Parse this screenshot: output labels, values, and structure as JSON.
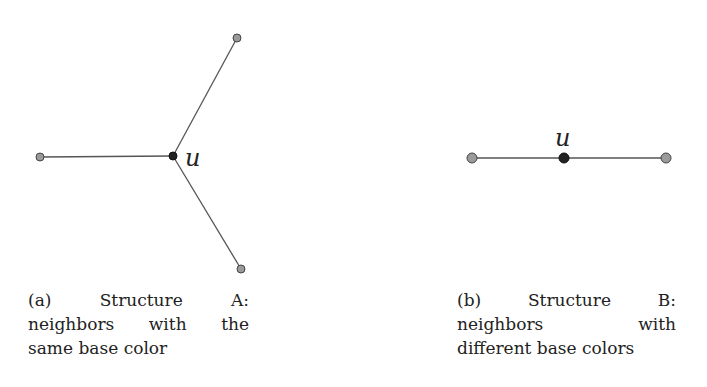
{
  "figures": [
    {
      "id": "a",
      "title": "Structure A",
      "center_label": "u",
      "caption_lines": [
        "(a) Structure A:",
        "neighbors with the",
        "same base color"
      ],
      "caption": "(a) Structure A: neighbors with the same base color",
      "nodes": [
        {
          "id": "u",
          "x": 173,
          "y": 156,
          "fill": "#222222",
          "role": "center"
        },
        {
          "id": "n1",
          "x": 40,
          "y": 157,
          "fill": "#9a9a9a",
          "role": "neighbor"
        },
        {
          "id": "n2",
          "x": 237,
          "y": 38,
          "fill": "#9a9a9a",
          "role": "neighbor"
        },
        {
          "id": "n3",
          "x": 241,
          "y": 269,
          "fill": "#9a9a9a",
          "role": "neighbor"
        }
      ],
      "edges": [
        [
          "u",
          "n1"
        ],
        [
          "u",
          "n2"
        ],
        [
          "u",
          "n3"
        ]
      ]
    },
    {
      "id": "b",
      "title": "Structure B",
      "center_label": "u",
      "caption_lines": [
        "(b) Structure B:",
        "neighbors with",
        "different base colors"
      ],
      "caption": "(b) Structure B: neighbors with different base colors",
      "nodes": [
        {
          "id": "u",
          "x": 564,
          "y": 158,
          "fill": "#222222",
          "role": "center"
        },
        {
          "id": "n1",
          "x": 472,
          "y": 158,
          "fill": "#9a9a9a",
          "role": "neighbor"
        },
        {
          "id": "n2",
          "x": 666,
          "y": 158,
          "fill": "#9a9a9a",
          "role": "neighbor"
        }
      ],
      "edges": [
        [
          "n1",
          "u"
        ],
        [
          "u",
          "n2"
        ]
      ]
    }
  ],
  "colors": {
    "edge": "#555555",
    "center_node": "#222222",
    "neighbor_node": "#9a9a9a",
    "node_outline": "#444444",
    "text": "#222222"
  }
}
